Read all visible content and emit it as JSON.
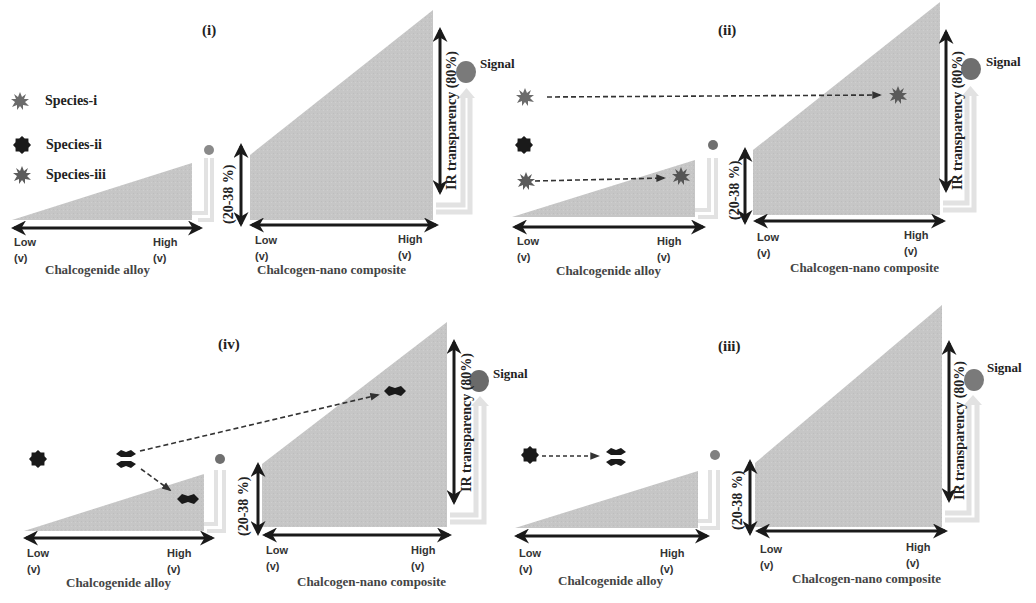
{
  "legend": {
    "items": [
      {
        "label": "Species-i",
        "icon": "spiky-burst-icon",
        "color": "#6b6b6b"
      },
      {
        "label": "Species-ii",
        "icon": "eight-point-star-icon",
        "color": "#1a1a1a"
      },
      {
        "label": "Species-iii",
        "icon": "spiky-burst-icon",
        "color": "#5c5c5c"
      }
    ]
  },
  "common": {
    "alloy_caption": "Chalcogenide alloy",
    "composite_caption": "Chalcogen-nano  composite",
    "low_label": "Low\n(v)",
    "high_label": "High\n(v)",
    "bandgap_label": "(20-38 %)",
    "ir_label": "IR transparency (80%)",
    "signal_label": "Signal"
  },
  "panels": [
    {
      "id": "i",
      "title": "(i)",
      "description": "Legend of species; no interaction"
    },
    {
      "id": "ii",
      "title": "(ii)",
      "description": "Species-i travels to composite; Species-iii travels to alloy"
    },
    {
      "id": "iii",
      "title": "(iii)",
      "description": "Species-ii transforms to dimer form"
    },
    {
      "id": "iv",
      "title": "(iv)",
      "description": "Dimer splits: one to alloy, one to composite"
    }
  ],
  "colors": {
    "fill": "#c4c4c4",
    "arrow": "#1a1a1a",
    "balloon": "#7a7a7a",
    "channel": "#e6e6e6"
  }
}
